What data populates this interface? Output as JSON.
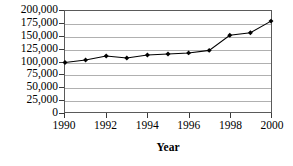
{
  "chart_data": {
    "type": "line",
    "title": "",
    "subtitle": "",
    "xlabel": "Year",
    "ylabel": "",
    "x": [
      1990,
      1991,
      1992,
      1993,
      1994,
      1995,
      1996,
      1997,
      1998,
      1999,
      2000
    ],
    "values": [
      98000,
      103000,
      111000,
      107000,
      113000,
      115000,
      117000,
      122000,
      152000,
      157000,
      180000
    ],
    "series": [
      {
        "name": "",
        "values": [
          98000,
          103000,
          111000,
          107000,
          113000,
          115000,
          117000,
          122000,
          152000,
          157000,
          180000
        ]
      }
    ],
    "xlim": [
      1990,
      2000
    ],
    "ylim": [
      0,
      200000
    ],
    "y_ticks": [
      0,
      25000,
      50000,
      75000,
      100000,
      125000,
      150000,
      175000,
      200000
    ],
    "y_tick_labels": [
      "0",
      "25,000",
      "50,000",
      "75,000",
      "100,000",
      "125,000",
      "150,000",
      "175,000",
      "200,000"
    ],
    "x_ticks": [
      1990,
      1992,
      1994,
      1996,
      1998,
      2000
    ],
    "x_tick_labels": [
      "1990",
      "1992",
      "1994",
      "1996",
      "1998",
      "2000"
    ],
    "grid": "horizontal",
    "legend": "none",
    "marker": "filled-diamond",
    "line_color": "#000000",
    "marker_color": "#000000",
    "grid_color": "#b0b0b0",
    "frame_color": "#5a5a5a",
    "background_color": "#ffffff"
  }
}
